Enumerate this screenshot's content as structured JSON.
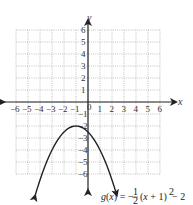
{
  "chart_data": {
    "type": "line",
    "title": "",
    "xlabel": "x",
    "ylabel": "y",
    "xlim": [
      -6,
      6
    ],
    "ylim": [
      -6,
      6
    ],
    "grid": true,
    "x_ticks": [
      "-6",
      "-5",
      "-4",
      "-3",
      "-2",
      "-1",
      "0",
      "1",
      "2",
      "3",
      "4",
      "5",
      "6"
    ],
    "y_ticks": [
      "6",
      "5",
      "4",
      "3",
      "2",
      "1",
      "-1",
      "-2",
      "-3",
      "-4",
      "-5",
      "-6"
    ],
    "series": [
      {
        "name": "g(x) = -1/2 (x + 1)^2 - 2",
        "equation": "g(x) = -½(x + 1)² - 2",
        "vertex": [
          -1,
          -2
        ],
        "opens": "down",
        "x": [
          -4.4,
          -4,
          -3,
          -2,
          -1,
          0,
          1,
          2,
          2.4
        ],
        "values": [
          -7.78,
          -6.5,
          -4,
          -2.5,
          -2,
          -2.5,
          -4,
          -6.5,
          -7.78
        ]
      }
    ],
    "annotations": [
      {
        "text": "g(x) = −",
        "frac_num": "1",
        "frac_den": "2",
        "rest": "(x + 1)",
        "exp": "2",
        "tail": " − 2",
        "position": "bottom-right"
      }
    ]
  },
  "labels": {
    "x_axis": "x",
    "y_axis": "y",
    "fn_prefix": "g(x) = −",
    "fn_num": "1",
    "fn_den": "2",
    "fn_mid": "(x + 1)",
    "fn_exp": "2",
    "fn_tail": " − 2"
  }
}
